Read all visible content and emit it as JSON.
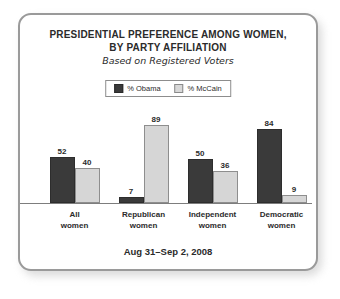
{
  "card": {
    "title_line1": "PRESIDENTIAL PREFERENCE AMONG WOMEN,",
    "title_line2": "BY PARTY AFFILIATION",
    "subtitle": "Based on Registered Voters",
    "footer": "Aug 31–Sep 2, 2008"
  },
  "legend": {
    "items": [
      {
        "label": "% Obama",
        "color": "#3a3a3a"
      },
      {
        "label": "% McCain",
        "color": "#d6d6d6"
      }
    ]
  },
  "categories": [
    {
      "line1": "All",
      "line2": "women"
    },
    {
      "line1": "Republican",
      "line2": "women"
    },
    {
      "line1": "Independent",
      "line2": "women"
    },
    {
      "line1": "Democratic",
      "line2": "women"
    }
  ],
  "values": {
    "obama": [
      "52",
      "7",
      "50",
      "84"
    ],
    "mccain": [
      "40",
      "89",
      "36",
      "9"
    ]
  },
  "chart_data": {
    "type": "bar",
    "title": "PRESIDENTIAL PREFERENCE AMONG WOMEN, BY PARTY AFFILIATION",
    "subtitle": "Based on Registered Voters",
    "annotation": "Aug 31–Sep 2, 2008",
    "categories": [
      "All women",
      "Republican women",
      "Independent women",
      "Democratic women"
    ],
    "series": [
      {
        "name": "% Obama",
        "values": [
          52,
          7,
          50,
          84
        ],
        "color": "#3a3a3a"
      },
      {
        "name": "% McCain",
        "values": [
          40,
          89,
          36,
          9
        ],
        "color": "#d6d6d6"
      }
    ],
    "xlabel": "",
    "ylabel": "",
    "ylim": [
      0,
      100
    ],
    "grid": false,
    "legend_position": "top-center",
    "data_labels": true
  }
}
